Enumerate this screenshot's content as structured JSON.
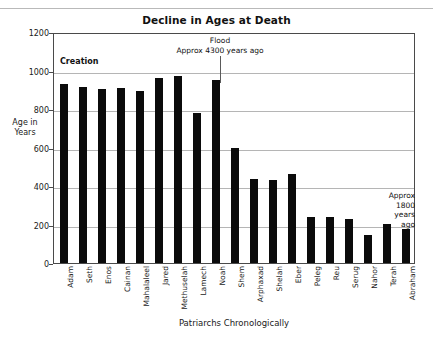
{
  "chart_data": {
    "type": "bar",
    "title": "Decline in Ages at Death",
    "xlabel": "Patriarchs Chronologically",
    "ylabel": "Age\nin\nYears",
    "ylim": [
      0,
      1200
    ],
    "ytick_values": [
      0,
      200,
      400,
      600,
      800,
      1000,
      1200
    ],
    "ytick_labels": [
      "0",
      "200",
      "400",
      "600",
      "800",
      "1000",
      "1200"
    ],
    "grid": true,
    "legend": "none",
    "bar_color": "#0b0b0b",
    "categories": [
      "Adam",
      "Seth",
      "Enos",
      "Cainan",
      "Mahalaleel",
      "Jared",
      "Methuselah",
      "Lamech",
      "Noah",
      "Shem",
      "Arphaxad",
      "Shelah",
      "Eber",
      "Peleg",
      "Reu",
      "Serug",
      "Nahor",
      "Terah",
      "Abraham"
    ],
    "values": [
      930,
      912,
      905,
      910,
      895,
      962,
      969,
      777,
      950,
      600,
      438,
      433,
      464,
      239,
      239,
      230,
      148,
      205,
      175
    ],
    "annotations": [
      {
        "name": "creation",
        "text": "Creation"
      },
      {
        "name": "flood",
        "text": "Flood\nApprox 4300 years ago"
      },
      {
        "name": "recent",
        "text": "Approx\n1800\nyears\nago"
      }
    ]
  },
  "annotations": {
    "creation": "Creation",
    "flood": "Flood\nApprox 4300 years ago",
    "recent": "Approx\n1800\nyears\nago"
  },
  "axes": {
    "y_title": "Age\nin\nYears",
    "x_title": "Patriarchs Chronologically"
  }
}
